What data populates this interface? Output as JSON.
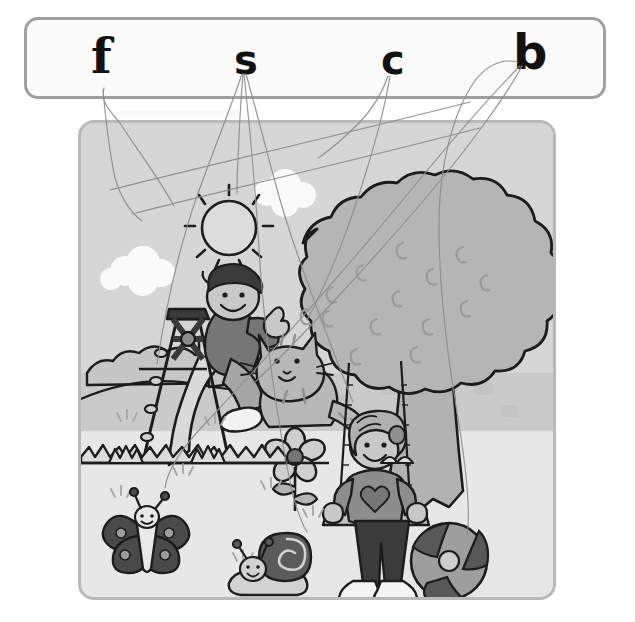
{
  "worksheet": {
    "title": "Phonics matching worksheet",
    "instruction_visible": false,
    "letter_bank": {
      "name": "letter-bank",
      "border_color": "#a0a0a0",
      "letters": [
        {
          "id": "f",
          "label": "f",
          "x": 88,
          "y": 33,
          "size": 48,
          "style": "serif"
        },
        {
          "id": "s",
          "label": "s",
          "x": 231,
          "y": 42,
          "size": 42,
          "style": "sans"
        },
        {
          "id": "c",
          "label": "c",
          "x": 378,
          "y": 42,
          "size": 42,
          "style": "sans"
        },
        {
          "id": "b",
          "label": "b",
          "x": 510,
          "y": 32,
          "size": 48,
          "style": "sans"
        }
      ]
    },
    "picture": {
      "name": "playground-picture",
      "border_color": "#b9b9b9",
      "background_color": "#dcdcdc",
      "sky_color": "#d7d7d7",
      "ground_color": "#e9e9e9",
      "midground_color": "#cfcfcf",
      "ink_color": "#1a1a1a",
      "objects": [
        {
          "name": "sun",
          "label": "sun"
        },
        {
          "name": "cloud-left",
          "label": "cloud"
        },
        {
          "name": "cloud-right",
          "label": "cloud"
        },
        {
          "name": "tree",
          "label": "tree"
        },
        {
          "name": "slide",
          "label": "slide"
        },
        {
          "name": "boy-on-slide",
          "label": "boy"
        },
        {
          "name": "cat",
          "label": "cat"
        },
        {
          "name": "girl-on-swing",
          "label": "girl"
        },
        {
          "name": "swing",
          "label": "swing"
        },
        {
          "name": "flower",
          "label": "flower"
        },
        {
          "name": "butterfly",
          "label": "butterfly"
        },
        {
          "name": "snail",
          "label": "snail"
        },
        {
          "name": "ball",
          "label": "ball"
        },
        {
          "name": "bushes",
          "label": "bushes"
        },
        {
          "name": "grass",
          "label": "grass"
        }
      ]
    },
    "answer_lines": {
      "name": "pencil-answer-lines",
      "stroke_color": "#8f8f94",
      "stroke_width": 1.1,
      "lines": [
        {
          "from_letter": "f",
          "to_object": "flower",
          "path": "M104,88 C100,104 112,112 122,126 C136,148 160,180 174,206"
        },
        {
          "from_letter": "f",
          "to_object": "cloud-left",
          "path": "M104,90 C106,110 110,150 116,178 C122,196 130,210 140,219"
        },
        {
          "from_letter": "s",
          "to_object": "sun",
          "path": "M243,74 C240,98 238,132 237,160 C236,172 236,182 236,192"
        },
        {
          "from_letter": "s",
          "to_object": "slide",
          "path": "M242,74 C232,104 212,152 196,196 C178,248 164,310 156,362"
        },
        {
          "from_letter": "s",
          "to_object": "snail",
          "path": "M244,74 C248,118 254,182 258,246 C262,320 276,420 292,494 C298,514 302,524 306,530"
        },
        {
          "from_letter": "s",
          "to_object": "swing",
          "path": "M246,74 C256,110 268,160 282,208 C300,268 330,344 352,400"
        },
        {
          "from_letter": "c",
          "to_object": "cloud-right",
          "path": "M388,76 C382,94 372,110 358,124 C344,138 330,150 318,158"
        },
        {
          "from_letter": "c",
          "to_object": "cat",
          "path": "M390,76 C386,100 378,134 366,172 C350,226 326,282 306,318"
        },
        {
          "from_letter": "b",
          "to_object": "ball",
          "path": "M518,62 C500,58 486,66 474,82 C456,108 444,150 440,196 C436,258 444,340 456,410 C466,470 470,510 466,534"
        },
        {
          "from_letter": "b",
          "to_object": "butterfly",
          "path": "M520,66 C494,92 452,140 406,196 C340,276 260,362 200,426 C178,450 166,470 164,486"
        },
        {
          "from_letter": "b",
          "to_object": "boy",
          "path": "M522,66 C506,96 470,146 424,200 C366,268 296,340 252,382"
        }
      ]
    }
  }
}
